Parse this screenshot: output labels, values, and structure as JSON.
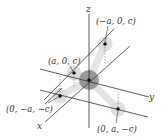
{
  "diagram": {
    "type": "3d-coordinate-molecule",
    "axes": {
      "x": {
        "label": "x"
      },
      "y": {
        "label": "y"
      },
      "z": {
        "label": "z"
      }
    },
    "points": [
      {
        "id": "p1",
        "label": "(−a, 0, c)"
      },
      {
        "id": "p2",
        "label": "(a, 0, c)"
      },
      {
        "id": "p3",
        "label": "(0, −a, −c)"
      },
      {
        "id": "p4",
        "label": "(0, a, −c)"
      }
    ],
    "center": {
      "label": "origin"
    },
    "colors": {
      "axis": "#333333",
      "atom_center": "#7a7a7a",
      "atom_outer": "#d9d9d9",
      "bond": "#e6e6e6",
      "guide": "#888888"
    }
  }
}
